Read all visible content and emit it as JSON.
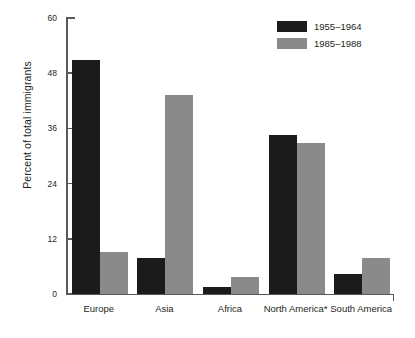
{
  "chart_data": {
    "type": "bar",
    "title": "",
    "subtitle": "",
    "xlabel": "",
    "ylabel": "Percent of total immigrants",
    "categories": [
      "Europe",
      "Asia",
      "Africa",
      "North America*",
      "South America"
    ],
    "series": [
      {
        "name": "1955–1964",
        "color": "#1b1b1b",
        "values": [
          50.8,
          7.8,
          1.5,
          34.6,
          4.3
        ]
      },
      {
        "name": "1985–1988",
        "color": "#8a8a8a",
        "values": [
          9.1,
          43.3,
          3.7,
          32.8,
          7.8
        ]
      }
    ],
    "ylim": [
      0,
      60
    ],
    "yticks": [
      0,
      12,
      24,
      36,
      48,
      60
    ],
    "ytick_labels": [
      "0",
      "12",
      "24",
      "36",
      "48",
      "60"
    ],
    "grid": false,
    "legend_position": "top-right",
    "annotations": [
      "* North America label carries an asterisk footnote marker"
    ]
  },
  "legend": {
    "entries": [
      {
        "label": "1955–1964",
        "swatch": "legend-swatch-dark"
      },
      {
        "label": "1985–1988",
        "swatch": "legend-swatch-gray"
      }
    ]
  },
  "colors": {
    "series_1": "#1b1b1b",
    "series_2": "#8a8a8a",
    "axis": "#58595b",
    "text": "#231f20",
    "background": "#ffffff"
  }
}
